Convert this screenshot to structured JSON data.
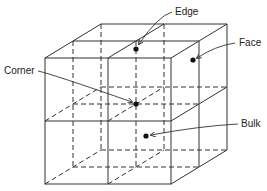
{
  "diagram": {
    "type": "cube-site-types",
    "labels": {
      "edge": "Edge",
      "face": "Face",
      "corner": "Corner",
      "bulk": "Bulk"
    },
    "colors": {
      "line": "#333333",
      "dot": "#111111",
      "background": "#ffffff"
    }
  }
}
